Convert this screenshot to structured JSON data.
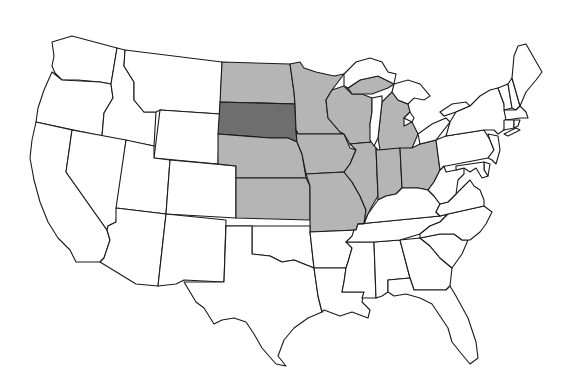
{
  "map": {
    "title": "United States map — Midwest region highlighted",
    "colors": {
      "background": "#ffffff",
      "unhighlighted": "#ffffff",
      "region": "#b5b5b5",
      "focus": "#6e6e6e",
      "border": "#1a1a1a"
    },
    "highlighted_region": "Midwest",
    "focus_state": "South Dakota",
    "region_states": [
      "North Dakota",
      "South Dakota",
      "Nebraska",
      "Kansas",
      "Minnesota",
      "Iowa",
      "Missouri",
      "Wisconsin",
      "Illinois",
      "Michigan",
      "Indiana",
      "Ohio"
    ],
    "legend": []
  }
}
